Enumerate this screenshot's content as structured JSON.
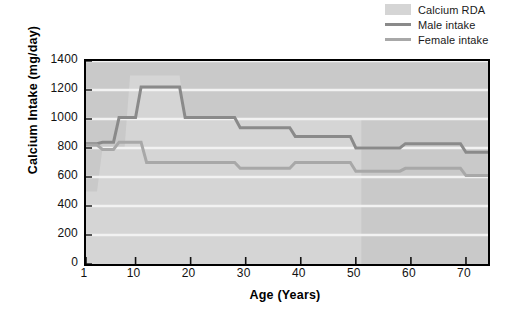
{
  "legend": {
    "items": [
      {
        "label": "Calcium RDA",
        "type": "band",
        "color": "#d5d5d5",
        "name": "legend-calcium-rda"
      },
      {
        "label": "Male intake",
        "type": "line",
        "color": "#8a8a8a",
        "name": "legend-male-intake"
      },
      {
        "label": "Female intake",
        "type": "line",
        "color": "#a8a8a8",
        "name": "legend-female-intake"
      }
    ]
  },
  "chart_data": {
    "type": "line",
    "title": "",
    "xlabel": "Age (Years)",
    "ylabel": "Calcium Intake (mg/day)",
    "xlim": [
      1,
      74
    ],
    "ylim": [
      0,
      1400
    ],
    "ytick_labels": [
      "0",
      "200",
      "400",
      "600",
      "800",
      "1000",
      "1200",
      "1400"
    ],
    "ytick_values": [
      0,
      200,
      400,
      600,
      800,
      1000,
      1200,
      1400
    ],
    "xtick_labels": [
      "1",
      "10",
      "20",
      "30",
      "40",
      "50",
      "60",
      "70"
    ],
    "xtick_values": [
      1,
      10,
      20,
      30,
      40,
      50,
      60,
      70
    ],
    "grid": "horizontal",
    "grid_color": "#f2f2f2",
    "plot_background": "#c9c9c9",
    "legend_position": "top-right",
    "band": {
      "name": "Calcium RDA",
      "color": "#d5d5d5",
      "x_end": 51,
      "steps": [
        {
          "x0": 1,
          "x1": 3,
          "value": 500
        },
        {
          "x0": 4,
          "x1": 8,
          "value": 800
        },
        {
          "x0": 9,
          "x1": 10,
          "value": 1300
        },
        {
          "x0": 11,
          "x1": 18,
          "value": 1300
        },
        {
          "x0": 19,
          "x1": 51,
          "value": 1000
        }
      ]
    },
    "series": [
      {
        "name": "Male intake",
        "color": "#8a8a8a",
        "steps": [
          {
            "x0": 1,
            "x1": 3,
            "value": 830
          },
          {
            "x0": 4,
            "x1": 6,
            "value": 840
          },
          {
            "x0": 7,
            "x1": 10,
            "value": 1010
          },
          {
            "x0": 11,
            "x1": 18,
            "value": 1220
          },
          {
            "x0": 19,
            "x1": 28,
            "value": 1010
          },
          {
            "x0": 29,
            "x1": 38,
            "value": 940
          },
          {
            "x0": 39,
            "x1": 49,
            "value": 880
          },
          {
            "x0": 50,
            "x1": 58,
            "value": 800
          },
          {
            "x0": 59,
            "x1": 69,
            "value": 830
          },
          {
            "x0": 70,
            "x1": 74,
            "value": 770
          }
        ]
      },
      {
        "name": "Female intake",
        "color": "#a8a8a8",
        "steps": [
          {
            "x0": 1,
            "x1": 3,
            "value": 820
          },
          {
            "x0": 4,
            "x1": 6,
            "value": 790
          },
          {
            "x0": 7,
            "x1": 11,
            "value": 840
          },
          {
            "x0": 12,
            "x1": 28,
            "value": 700
          },
          {
            "x0": 29,
            "x1": 38,
            "value": 660
          },
          {
            "x0": 39,
            "x1": 49,
            "value": 700
          },
          {
            "x0": 50,
            "x1": 58,
            "value": 640
          },
          {
            "x0": 59,
            "x1": 69,
            "value": 660
          },
          {
            "x0": 70,
            "x1": 74,
            "value": 610
          }
        ]
      }
    ]
  }
}
